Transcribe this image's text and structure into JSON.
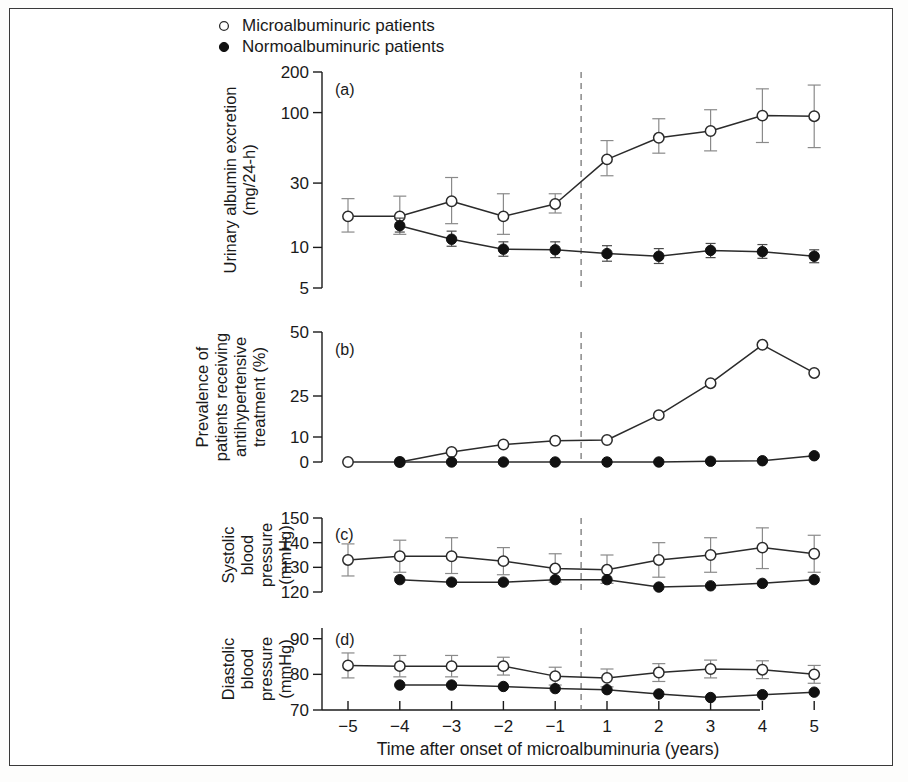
{
  "figure": {
    "caption_x_axis": "Time after onset of microalbuminuria (years)",
    "legend": [
      {
        "marker": "open-circle",
        "label": "Microalbuminuric patients"
      },
      {
        "marker": "filled-circle",
        "label": "Normoalbuminuric patients"
      }
    ],
    "colors": {
      "line": "#2b2b2b",
      "errorbar": "#8a8a8a",
      "frame": "#3a3a3a",
      "text": "#1a1a1a",
      "open_marker_fill": "#ffffff",
      "filled_marker_fill": "#111111",
      "reference_line": "#777777"
    },
    "reference_line_note": "dashed vertical line at onset (between year -1 and year 1)"
  },
  "chart_data": [
    {
      "type": "line",
      "panel": "(a)",
      "title": "",
      "ylabel": "Urinary albumin excretion (mg/24-h)",
      "ylabel_line1": "Urinary albumin excretion",
      "ylabel_line2": "(mg/24-h)",
      "xlabel": "Time after onset of microalbuminuria (years)",
      "yscale": "log",
      "ylim": [
        5,
        200
      ],
      "yticks": [
        5,
        10,
        30,
        100,
        200
      ],
      "ytick_labels": [
        "5",
        "10",
        "30",
        "100",
        "200"
      ],
      "x": [
        -5,
        -4,
        -3,
        -2,
        -1,
        1,
        2,
        3,
        4,
        5
      ],
      "xtick_labels": [
        "-5",
        "-4",
        "-3",
        "-2",
        "-1",
        "1",
        "2",
        "3",
        "4",
        "5"
      ],
      "grid": false,
      "series": [
        {
          "name": "Microalbuminuric patients",
          "marker": "open-circle",
          "values": [
            17,
            17,
            22,
            17,
            21,
            45,
            65,
            73,
            95,
            94
          ],
          "err_low": [
            13,
            12.5,
            15,
            12.5,
            18,
            34,
            50,
            52,
            60,
            55
          ],
          "err_high": [
            23,
            24,
            33,
            25,
            25,
            62,
            90,
            105,
            150,
            160
          ]
        },
        {
          "name": "Normoalbuminuric patients",
          "marker": "filled-circle",
          "values": [
            null,
            14.5,
            11.5,
            9.7,
            9.6,
            9.0,
            8.6,
            9.5,
            9.3,
            8.6
          ],
          "err_low": [
            null,
            13,
            10.2,
            8.6,
            8.4,
            7.9,
            7.6,
            8.4,
            8.3,
            7.7
          ],
          "err_high": [
            null,
            16.5,
            13.2,
            11.0,
            11.0,
            10.3,
            9.8,
            10.7,
            10.5,
            9.6
          ]
        }
      ]
    },
    {
      "type": "line",
      "panel": "(b)",
      "title": "",
      "ylabel": "Prevalence of patients receiving antihypertensive treatment (%)",
      "ylabel_line1": "Prevalence of",
      "ylabel_line2": "patients receiving",
      "ylabel_line3": "antihypertensive",
      "ylabel_line4": "treatment (%)",
      "xlabel": "Time after onset of microalbuminuria (years)",
      "yscale": "nonlinear-compressed",
      "ylim": [
        0,
        50
      ],
      "yticks": [
        0,
        10,
        25,
        50
      ],
      "ytick_labels": [
        "0",
        "10",
        "25",
        "50"
      ],
      "x": [
        -5,
        -4,
        -3,
        -2,
        -1,
        1,
        2,
        3,
        4,
        5
      ],
      "xtick_labels": [
        "-5",
        "-4",
        "-3",
        "-2",
        "-1",
        "1",
        "2",
        "3",
        "4",
        "5"
      ],
      "grid": false,
      "series": [
        {
          "name": "Microalbuminuric patients",
          "marker": "open-circle",
          "values": [
            0,
            0,
            4,
            7,
            8.5,
            8.8,
            18,
            30,
            45,
            34
          ]
        },
        {
          "name": "Normoalbuminuric patients",
          "marker": "filled-circle",
          "values": [
            null,
            0,
            0,
            0,
            0,
            0,
            0,
            0.3,
            0.5,
            2.5
          ]
        }
      ]
    },
    {
      "type": "line",
      "panel": "(c)",
      "title": "",
      "ylabel": "Systolic blood pressure (mmHg)",
      "ylabel_line1": "Systolic",
      "ylabel_line2": "blood",
      "ylabel_line3": "pressure",
      "ylabel_line4": "(mmHg)",
      "xlabel": "Time after onset of microalbuminuria (years)",
      "yscale": "linear",
      "ylim": [
        120,
        150
      ],
      "yticks": [
        120,
        130,
        140,
        150
      ],
      "ytick_labels": [
        "120",
        "130",
        "140",
        "150"
      ],
      "x": [
        -5,
        -4,
        -3,
        -2,
        -1,
        1,
        2,
        3,
        4,
        5
      ],
      "xtick_labels": [
        "-5",
        "-4",
        "-3",
        "-2",
        "-1",
        "1",
        "2",
        "3",
        "4",
        "5"
      ],
      "grid": false,
      "series": [
        {
          "name": "Microalbuminuric patients",
          "marker": "open-circle",
          "values": [
            133,
            134.5,
            134.5,
            132.5,
            129.5,
            129,
            133,
            135,
            138,
            135.5
          ],
          "err_low": [
            126.5,
            128,
            127.5,
            127,
            124,
            123.5,
            126,
            128,
            129.5,
            128
          ],
          "err_high": [
            139.5,
            141,
            142,
            138,
            135.5,
            135,
            140,
            142,
            146,
            143
          ]
        },
        {
          "name": "Normoalbuminuric patients",
          "marker": "filled-circle",
          "values": [
            null,
            125,
            124,
            124,
            125,
            125,
            122,
            122.5,
            123.5,
            125
          ]
        }
      ]
    },
    {
      "type": "line",
      "panel": "(d)",
      "title": "",
      "ylabel": "Diastolic blood pressure (mmHg)",
      "ylabel_line1": "Diastolic",
      "ylabel_line2": "blood",
      "ylabel_line3": "pressure",
      "ylabel_line4": "(mmHg)",
      "xlabel": "Time after onset of microalbuminuria (years)",
      "yscale": "linear",
      "ylim": [
        70,
        93
      ],
      "yticks": [
        70,
        80,
        90
      ],
      "ytick_labels": [
        "70",
        "80",
        "90"
      ],
      "x": [
        -5,
        -4,
        -3,
        -2,
        -1,
        1,
        2,
        3,
        4,
        5
      ],
      "xtick_labels": [
        "-5",
        "-4",
        "-3",
        "-2",
        "-1",
        "1",
        "2",
        "3",
        "4",
        "5"
      ],
      "grid": false,
      "series": [
        {
          "name": "Microalbuminuric patients",
          "marker": "open-circle",
          "values": [
            82.5,
            82.3,
            82.3,
            82.3,
            79.5,
            79,
            80.5,
            81.5,
            81.3,
            80
          ],
          "err_low": [
            79,
            79.3,
            79.3,
            79.8,
            77,
            76.5,
            78,
            79,
            78.8,
            77.5
          ],
          "err_high": [
            86,
            85.3,
            85.3,
            84.8,
            82,
            81.5,
            83,
            84,
            83.8,
            82.5
          ]
        },
        {
          "name": "Normoalbuminuric patients",
          "marker": "filled-circle",
          "values": [
            null,
            77,
            77,
            76.6,
            76,
            75.7,
            74.5,
            73.5,
            74.3,
            75
          ]
        }
      ]
    }
  ]
}
